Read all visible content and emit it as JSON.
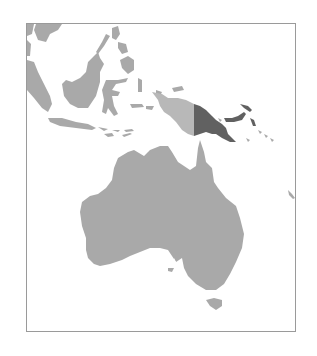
{
  "map": {
    "title": "Papua New Guinea location map",
    "region": "Maritime Southeast Asia and Australia",
    "highlighted_country": "Papua New Guinea",
    "colors": {
      "background": "#ffffff",
      "land": "#a9a9a9",
      "neighbor_light": "#b8b8b8",
      "highlight": "#616161",
      "frame_border": "#9a9a9a",
      "coastline_gap": "#ffffff"
    },
    "features": [
      {
        "name": "Papua New Guinea",
        "role": "highlight"
      },
      {
        "name": "Western New Guinea (Indonesia)",
        "role": "neighbor"
      },
      {
        "name": "Australia",
        "role": "land"
      },
      {
        "name": "Tasmania",
        "role": "land"
      },
      {
        "name": "Borneo",
        "role": "land"
      },
      {
        "name": "Sumatra",
        "role": "land"
      },
      {
        "name": "Java",
        "role": "land"
      },
      {
        "name": "Sulawesi",
        "role": "land"
      },
      {
        "name": "Philippines",
        "role": "land"
      },
      {
        "name": "Malay Peninsula",
        "role": "land"
      },
      {
        "name": "Lesser Sunda Islands",
        "role": "land"
      },
      {
        "name": "Maluku Islands",
        "role": "land"
      },
      {
        "name": "Bismarck Archipelago",
        "role": "highlight"
      },
      {
        "name": "Solomon Islands",
        "role": "land"
      }
    ]
  }
}
